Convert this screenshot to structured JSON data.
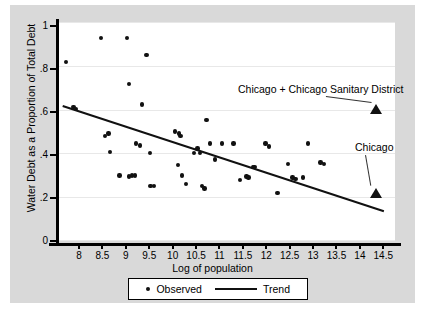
{
  "chart_data": {
    "type": "scatter",
    "title": "",
    "xlabel": "Log of population",
    "ylabel": "Water Debt as a Proportion of Total Debt",
    "xlim": [
      7.55,
      14.75
    ],
    "ylim": [
      0,
      1.02
    ],
    "grid": true,
    "xticks": [
      8,
      8.5,
      9,
      9.5,
      10,
      10.5,
      11,
      11.5,
      12,
      12.5,
      13,
      13.5,
      14,
      14.5
    ],
    "xtick_labels": [
      "8",
      "8.5",
      "9",
      "9.5",
      "10",
      "10.5",
      "11",
      "11.5",
      "12",
      "12.5",
      "13",
      "13.5",
      "14",
      "14.5"
    ],
    "yticks": [
      0,
      0.2,
      0.4,
      0.6,
      0.8,
      1
    ],
    "ytick_labels": [
      "0",
      ".2",
      ".4",
      ".6",
      ".8",
      "1"
    ],
    "legend_position": "bottom-outside",
    "legend": [
      {
        "label": "Observed",
        "marker": "dot"
      },
      {
        "label": "Trend",
        "marker": "line"
      }
    ],
    "series": [
      {
        "name": "Observed",
        "marker": "dot",
        "points": [
          [
            7.72,
            0.835
          ],
          [
            7.88,
            0.625
          ],
          [
            7.93,
            0.615
          ],
          [
            8.47,
            0.945
          ],
          [
            8.55,
            0.49
          ],
          [
            8.63,
            0.5
          ],
          [
            8.66,
            0.415
          ],
          [
            8.86,
            0.305
          ],
          [
            9.07,
            0.3
          ],
          [
            9.13,
            0.305
          ],
          [
            9.19,
            0.305
          ],
          [
            9.02,
            0.945
          ],
          [
            9.07,
            0.73
          ],
          [
            9.21,
            0.455
          ],
          [
            9.3,
            0.445
          ],
          [
            9.44,
            0.865
          ],
          [
            9.35,
            0.635
          ],
          [
            9.52,
            0.41
          ],
          [
            9.53,
            0.255
          ],
          [
            9.6,
            0.255
          ],
          [
            10.05,
            0.51
          ],
          [
            10.11,
            0.355
          ],
          [
            10.14,
            0.5
          ],
          [
            10.17,
            0.49
          ],
          [
            10.2,
            0.305
          ],
          [
            10.28,
            0.265
          ],
          [
            10.46,
            0.41
          ],
          [
            10.53,
            0.43
          ],
          [
            10.58,
            0.41
          ],
          [
            10.62,
            0.255
          ],
          [
            10.68,
            0.245
          ],
          [
            10.72,
            0.565
          ],
          [
            10.8,
            0.455
          ],
          [
            10.9,
            0.38
          ],
          [
            11.06,
            0.455
          ],
          [
            11.3,
            0.455
          ],
          [
            11.44,
            0.285
          ],
          [
            11.58,
            0.3
          ],
          [
            11.62,
            0.295
          ],
          [
            11.72,
            0.345
          ],
          [
            11.75,
            0.345
          ],
          [
            11.98,
            0.455
          ],
          [
            12.06,
            0.44
          ],
          [
            12.24,
            0.225
          ],
          [
            12.47,
            0.36
          ],
          [
            12.56,
            0.295
          ],
          [
            12.62,
            0.29
          ],
          [
            12.78,
            0.295
          ],
          [
            12.89,
            0.455
          ],
          [
            13.16,
            0.365
          ],
          [
            13.23,
            0.36
          ]
        ]
      },
      {
        "name": "Chicago + Chicago Sanitary District",
        "marker": "triangle",
        "points": [
          [
            14.35,
            0.615
          ]
        ]
      },
      {
        "name": "Chicago",
        "marker": "triangle",
        "points": [
          [
            14.35,
            0.225
          ]
        ]
      }
    ],
    "trend": {
      "name": "Trend",
      "x": [
        7.66,
        14.52
      ],
      "y": [
        0.635,
        0.145
      ]
    },
    "annotations": [
      {
        "text": "Chicago + Chicago Sanitary District",
        "target": [
          14.35,
          0.615
        ]
      },
      {
        "text": "Chicago",
        "target": [
          14.35,
          0.225
        ]
      }
    ]
  }
}
